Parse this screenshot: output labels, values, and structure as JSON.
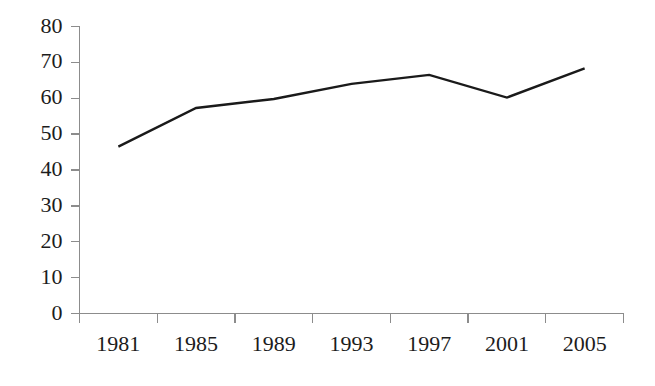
{
  "chart_data": {
    "type": "line",
    "title": "",
    "subtitle": "",
    "xlabel": "",
    "ylabel": "",
    "categories": [
      "1981",
      "1985",
      "1989",
      "1993",
      "1997",
      "2001",
      "2005"
    ],
    "x": [
      1981,
      1985,
      1989,
      1993,
      1997,
      2001,
      2005
    ],
    "values": [
      46.5,
      57.3,
      59.8,
      64.0,
      66.5,
      60.2,
      68.3
    ],
    "series": [
      {
        "name": "",
        "values": [
          46.5,
          57.3,
          59.8,
          64.0,
          66.5,
          60.2,
          68.3
        ]
      }
    ],
    "ylim": [
      0,
      80
    ],
    "yticks": [
      0,
      10,
      20,
      30,
      40,
      50,
      60,
      70,
      80
    ],
    "ytick_labels": [
      "0",
      "10",
      "20",
      "30",
      "40",
      "50",
      "60",
      "70",
      "80"
    ],
    "xtick_labels": [
      "1981",
      "1985",
      "1989",
      "1993",
      "1997",
      "2001",
      "2005"
    ],
    "grid": false,
    "legend": false,
    "legend_position": "none",
    "markers": false,
    "annotations": [],
    "colors": {
      "series_line": "#1a1a1a",
      "axis": "#8c8c8c",
      "text": "#1c1c1c",
      "background": "#ffffff"
    }
  }
}
